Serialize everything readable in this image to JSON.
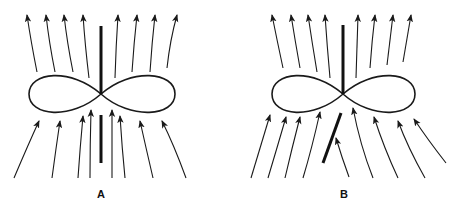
{
  "panels": [
    {
      "label": "A",
      "center": [
        101,
        94
      ],
      "loop": {
        "left": 29,
        "right": 175,
        "top": 74,
        "bottom": 115
      },
      "bars": [
        {
          "x1": 101,
          "y1": 26,
          "x2": 101,
          "y2": 94
        },
        {
          "x1": 101,
          "y1": 115,
          "x2": 101,
          "y2": 163
        }
      ],
      "arrows": [
        {
          "from": [
            37,
            72
          ],
          "ctrl": [
            31,
            42
          ],
          "to": [
            27,
            15
          ]
        },
        {
          "from": [
            55,
            72
          ],
          "ctrl": [
            49,
            42
          ],
          "to": [
            46,
            15
          ]
        },
        {
          "from": [
            73,
            72
          ],
          "ctrl": [
            67,
            42
          ],
          "to": [
            64,
            15
          ]
        },
        {
          "from": [
            89,
            78
          ],
          "ctrl": [
            85,
            45
          ],
          "to": [
            83,
            15
          ]
        },
        {
          "from": [
            115,
            78
          ],
          "ctrl": [
            116,
            45
          ],
          "to": [
            118,
            15
          ]
        },
        {
          "from": [
            132,
            72
          ],
          "ctrl": [
            134,
            42
          ],
          "to": [
            137,
            15
          ]
        },
        {
          "from": [
            150,
            72
          ],
          "ctrl": [
            152,
            42
          ],
          "to": [
            155,
            15
          ]
        },
        {
          "from": [
            167,
            68
          ],
          "ctrl": [
            170,
            40
          ],
          "to": [
            177,
            15
          ]
        },
        {
          "from": [
            14,
            178
          ],
          "ctrl": [
            28,
            145
          ],
          "to": [
            39,
            121
          ]
        },
        {
          "from": [
            52,
            178
          ],
          "ctrl": [
            56,
            148
          ],
          "to": [
            60,
            121
          ]
        },
        {
          "from": [
            78,
            178
          ],
          "ctrl": [
            80,
            148
          ],
          "to": [
            83,
            116
          ]
        },
        {
          "from": [
            90,
            178
          ],
          "ctrl": [
            90,
            145
          ],
          "to": [
            91,
            110
          ]
        },
        {
          "from": [
            112,
            178
          ],
          "ctrl": [
            112,
            145
          ],
          "to": [
            112,
            110
          ]
        },
        {
          "from": [
            125,
            178
          ],
          "ctrl": [
            122,
            148
          ],
          "to": [
            120,
            116
          ]
        },
        {
          "from": [
            153,
            178
          ],
          "ctrl": [
            146,
            148
          ],
          "to": [
            140,
            121
          ]
        },
        {
          "from": [
            186,
            178
          ],
          "ctrl": [
            174,
            145
          ],
          "to": [
            162,
            121
          ]
        }
      ]
    },
    {
      "label": "B",
      "center": [
        343,
        94
      ],
      "loop": {
        "left": 272,
        "right": 415,
        "top": 74,
        "bottom": 115
      },
      "bars": [
        {
          "x1": 343,
          "y1": 25,
          "x2": 343,
          "y2": 94
        },
        {
          "x1": 341,
          "y1": 113,
          "x2": 323,
          "y2": 163
        }
      ],
      "arrows": [
        {
          "from": [
            283,
            68
          ],
          "ctrl": [
            277,
            40
          ],
          "to": [
            272,
            15
          ]
        },
        {
          "from": [
            300,
            68
          ],
          "ctrl": [
            295,
            40
          ],
          "to": [
            291,
            15
          ]
        },
        {
          "from": [
            317,
            72
          ],
          "ctrl": [
            312,
            42
          ],
          "to": [
            308,
            15
          ]
        },
        {
          "from": [
            330,
            78
          ],
          "ctrl": [
            327,
            45
          ],
          "to": [
            325,
            15
          ]
        },
        {
          "from": [
            356,
            78
          ],
          "ctrl": [
            357,
            45
          ],
          "to": [
            358,
            15
          ]
        },
        {
          "from": [
            370,
            68
          ],
          "ctrl": [
            372,
            40
          ],
          "to": [
            375,
            15
          ]
        },
        {
          "from": [
            387,
            65
          ],
          "ctrl": [
            390,
            40
          ],
          "to": [
            393,
            15
          ]
        },
        {
          "from": [
            403,
            62
          ],
          "ctrl": [
            407,
            38
          ],
          "to": [
            411,
            15
          ]
        },
        {
          "from": [
            251,
            178
          ],
          "ctrl": [
            260,
            148
          ],
          "to": [
            270,
            115
          ]
        },
        {
          "from": [
            268,
            178
          ],
          "ctrl": [
            277,
            148
          ],
          "to": [
            286,
            117
          ]
        },
        {
          "from": [
            285,
            178
          ],
          "ctrl": [
            292,
            148
          ],
          "to": [
            300,
            117
          ]
        },
        {
          "from": [
            303,
            178
          ],
          "ctrl": [
            312,
            148
          ],
          "to": [
            320,
            112
          ]
        },
        {
          "from": [
            349,
            177
          ],
          "ctrl": [
            342,
            158
          ],
          "to": [
            336,
            138
          ]
        },
        {
          "from": [
            373,
            178
          ],
          "ctrl": [
            360,
            145
          ],
          "to": [
            353,
            108
          ]
        },
        {
          "from": [
            398,
            178
          ],
          "ctrl": [
            384,
            148
          ],
          "to": [
            374,
            117
          ]
        },
        {
          "from": [
            425,
            178
          ],
          "ctrl": [
            408,
            148
          ],
          "to": [
            398,
            121
          ]
        },
        {
          "from": [
            446,
            163
          ],
          "ctrl": [
            428,
            140
          ],
          "to": [
            414,
            119
          ]
        }
      ]
    }
  ]
}
